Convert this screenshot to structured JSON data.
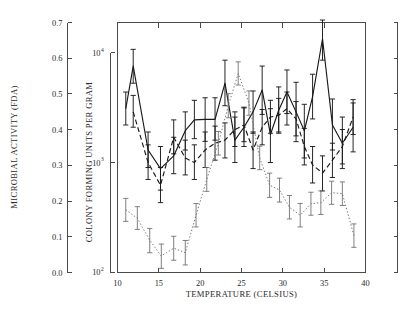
{
  "chart_data": {
    "type": "line",
    "title": "",
    "xlabel": "TEMPERATURE (CELSIUS)",
    "ylabel_left": "MICROBIAL ACTIVITY (FDA)",
    "ylabel_inner": "COLONY FORMING UNITS PER GRAM",
    "xlim": [
      10,
      40
    ],
    "xticks": [
      10,
      15,
      20,
      25,
      30,
      35,
      40
    ],
    "xtick_labels": [
      "10",
      "15",
      "20",
      "25",
      "30",
      "35",
      "40"
    ],
    "left_axis": {
      "label": "MICROBIAL ACTIVITY (FDA)",
      "lim": [
        0.0,
        0.7
      ],
      "ticks": [
        0.0,
        0.1,
        0.2,
        0.3,
        0.4,
        0.5,
        0.6,
        0.7
      ],
      "tick_labels": [
        "0.0",
        "0.1",
        "0.2",
        "0.3",
        "0.4",
        "0.5",
        "0.6",
        "0.7"
      ],
      "scale": "linear"
    },
    "inner_axis": {
      "label": "COLONY FORMING UNITS PER GRAM",
      "scale": "log",
      "lim": [
        100,
        10000
      ],
      "ticks": [
        100,
        1000,
        10000
      ],
      "tick_labels": [
        "10",
        "10",
        "10"
      ],
      "tick_exponents": [
        "2",
        "3",
        "4"
      ]
    },
    "right_axis": {
      "label": "",
      "ticks_count": 8,
      "scale": "linear"
    },
    "grid": false,
    "legend": null,
    "series": [
      {
        "name": "solid",
        "style": "solid",
        "color": "#1a1a1a",
        "axis": "inner-log",
        "x": [
          11,
          11.9,
          13.7,
          15.2,
          16.8,
          18.2,
          19.3,
          20.6,
          21.8,
          23.0,
          24.2,
          25.3,
          26.4,
          27.5,
          28.5,
          29.5,
          30.5,
          31.6,
          32.6,
          33.6,
          34.8,
          36.0,
          37.2,
          38.5
        ],
        "values": [
          3100,
          7600,
          1300,
          880,
          1150,
          1950,
          2450,
          2480,
          2480,
          5300,
          1600,
          2100,
          2900,
          4600,
          1800,
          3000,
          4400,
          2900,
          1950,
          4000,
          13500,
          2200,
          1500,
          2100
        ],
        "err_low": [
          2200,
          5300,
          900,
          560,
          790,
          1300,
          1650,
          1560,
          1600,
          3300,
          1000,
          1400,
          1850,
          2750,
          1000,
          1850,
          2800,
          1550,
          1100,
          2500,
          8600,
          1300,
          880,
          1250
        ],
        "err_high": [
          4400,
          10800,
          1900,
          1400,
          1700,
          2900,
          3700,
          3900,
          3900,
          8600,
          2600,
          3200,
          4500,
          7600,
          3100,
          4900,
          7000,
          5400,
          3400,
          6400,
          20000,
          3800,
          2600,
          3500
        ]
      },
      {
        "name": "dashed",
        "style": "dashed",
        "color": "#1a1a1a",
        "axis": "inner-log",
        "x": [
          11.9,
          13.7,
          15.2,
          16.8,
          18.2,
          19.3,
          20.6,
          21.8,
          23.0,
          24.2,
          25.3,
          26.4,
          27.5,
          28.5,
          29.5,
          30.5,
          31.6,
          32.6,
          33.6,
          34.8,
          36.0,
          37.2,
          38.5
        ],
        "values": [
          2900,
          1000,
          620,
          1700,
          1100,
          1000,
          1300,
          1500,
          1600,
          2000,
          2200,
          1300,
          2100,
          2600,
          2700,
          3100,
          2500,
          1400,
          950,
          800,
          1050,
          1400,
          2600
        ],
        "err_low": [
          2100,
          700,
          430,
          1200,
          770,
          700,
          900,
          1050,
          1100,
          1400,
          1550,
          880,
          1450,
          1850,
          1900,
          2200,
          1750,
          950,
          650,
          550,
          730,
          970,
          1800
        ],
        "err_high": [
          4100,
          1450,
          900,
          2450,
          1600,
          1450,
          1900,
          2150,
          2300,
          2900,
          3150,
          1900,
          3050,
          3700,
          3850,
          4400,
          3600,
          2050,
          1400,
          1150,
          1500,
          2000,
          3750
        ]
      },
      {
        "name": "dotted",
        "style": "dotted",
        "color": "#6a6a6a",
        "axis": "inner-log",
        "x": [
          11,
          12.4,
          13.9,
          15.3,
          16.8,
          18.2,
          19.5,
          20.8,
          22.2,
          23.4,
          24.6,
          25.9,
          27.2,
          28.4,
          29.6,
          30.8,
          32.1,
          33.4,
          34.6,
          35.9,
          37.2,
          38.6
        ],
        "values": [
          370,
          310,
          195,
          140,
          165,
          150,
          330,
          700,
          1500,
          3300,
          6500,
          3500,
          1100,
          620,
          560,
          390,
          330,
          420,
          430,
          530,
          520,
          215
        ],
        "err_low": [
          290,
          245,
          150,
          108,
          128,
          116,
          258,
          545,
          1170,
          2560,
          5100,
          2700,
          860,
          480,
          435,
          305,
          258,
          330,
          335,
          415,
          405,
          168
        ],
        "err_high": [
          470,
          395,
          250,
          180,
          212,
          194,
          422,
          900,
          1920,
          4250,
          8300,
          4500,
          1410,
          800,
          720,
          500,
          423,
          535,
          550,
          675,
          665,
          275
        ]
      }
    ]
  },
  "figure": {
    "xaxis_label": "TEMPERATURE (CELSIUS)",
    "left_axis_label": "MICROBIAL ACTIVITY (FDA)",
    "inner_axis_label": "COLONY FORMING UNITS PER GRAM",
    "left_ticks": [
      "0.7",
      "0.6",
      "0.5",
      "0.4",
      "0.3",
      "0.2",
      "0.1",
      "0.0"
    ],
    "log_ticks": [
      {
        "mantissa": "10",
        "exp": "4"
      },
      {
        "mantissa": "10",
        "exp": "3"
      },
      {
        "mantissa": "10",
        "exp": "2"
      }
    ],
    "x_ticks": [
      "10",
      "15",
      "20",
      "25",
      "30",
      "35",
      "40"
    ]
  }
}
